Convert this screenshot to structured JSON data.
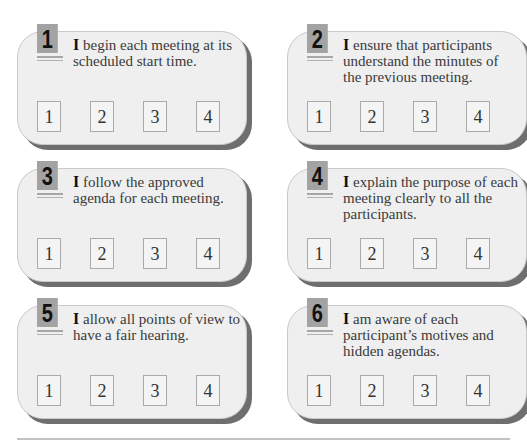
{
  "rating_scale": [
    "1",
    "2",
    "3",
    "4"
  ],
  "items": [
    {
      "number": "1",
      "first_word": "I",
      "text": " begin each meeting at its scheduled start time."
    },
    {
      "number": "2",
      "first_word": "I",
      "text": " ensure that participants understand the minutes of the previous meeting."
    },
    {
      "number": "3",
      "first_word": "I",
      "text": " follow the approved agenda for each meeting."
    },
    {
      "number": "4",
      "first_word": "I",
      "text": " explain the purpose of each meeting clearly to all the participants."
    },
    {
      "number": "5",
      "first_word": "I",
      "text": " allow all points of view to have a fair hearing."
    },
    {
      "number": "6",
      "first_word": "I",
      "text": " am aware of each participant’s motives and hidden agendas."
    }
  ]
}
